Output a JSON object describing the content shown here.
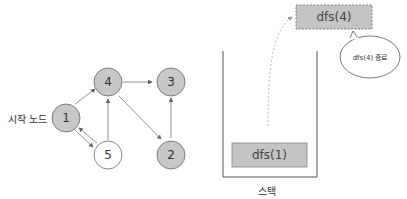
{
  "graph": {
    "start_label": "시작 노드",
    "nodes": [
      {
        "id": "1",
        "label": "1",
        "visited": true
      },
      {
        "id": "2",
        "label": "2",
        "visited": true
      },
      {
        "id": "3",
        "label": "3",
        "visited": true
      },
      {
        "id": "4",
        "label": "4",
        "visited": true
      },
      {
        "id": "5",
        "label": "5",
        "visited": false
      }
    ],
    "edges": [
      {
        "from": "1",
        "to": "4"
      },
      {
        "from": "4",
        "to": "3"
      },
      {
        "from": "4",
        "to": "2"
      },
      {
        "from": "2",
        "to": "3"
      },
      {
        "from": "5",
        "to": "4"
      },
      {
        "from": "1",
        "to": "5"
      },
      {
        "from": "5",
        "to": "1"
      }
    ]
  },
  "stack": {
    "label": "스택",
    "frames": [
      {
        "label": "dfs(1)"
      }
    ],
    "popped": {
      "label": "dfs(4)"
    },
    "callout": "dfs(4) 종료"
  },
  "colors": {
    "visited_fill": "#c8c8c8",
    "unvisited_fill": "#ffffff",
    "stroke": "#555555"
  }
}
